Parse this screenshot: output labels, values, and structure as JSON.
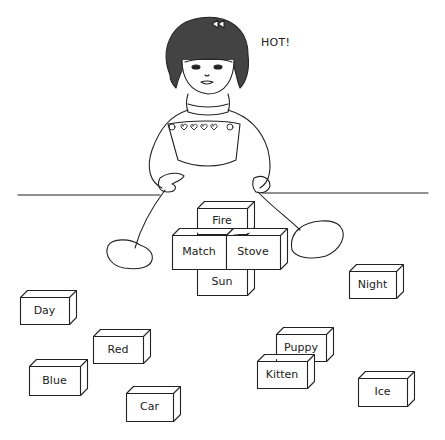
{
  "illustration": {
    "speech_text": "HOT!",
    "line_color": "#222222",
    "background": "#ffffff"
  },
  "center_blocks": [
    {
      "word": "Fire",
      "x": 197,
      "y": 208,
      "w": 50,
      "h": 26
    },
    {
      "word": "Match",
      "x": 172,
      "y": 235,
      "w": 54,
      "h": 34
    },
    {
      "word": "Stove",
      "x": 226,
      "y": 235,
      "w": 54,
      "h": 34
    },
    {
      "word": "Sun",
      "x": 197,
      "y": 269,
      "w": 50,
      "h": 26
    }
  ],
  "scattered_blocks": [
    {
      "word": "Day",
      "x": 20,
      "y": 297,
      "w": 49,
      "h": 27
    },
    {
      "word": "Red",
      "x": 93,
      "y": 336,
      "w": 50,
      "h": 27
    },
    {
      "word": "Blue",
      "x": 29,
      "y": 366,
      "w": 51,
      "h": 29
    },
    {
      "word": "Car",
      "x": 126,
      "y": 393,
      "w": 47,
      "h": 28
    },
    {
      "word": "Night",
      "x": 349,
      "y": 271,
      "w": 47,
      "h": 27
    },
    {
      "word": "Puppy",
      "x": 276,
      "y": 334,
      "w": 50,
      "h": 27
    },
    {
      "word": "Kitten",
      "x": 257,
      "y": 361,
      "w": 50,
      "h": 27
    },
    {
      "word": "Ice",
      "x": 358,
      "y": 378,
      "w": 49,
      "h": 28
    }
  ]
}
